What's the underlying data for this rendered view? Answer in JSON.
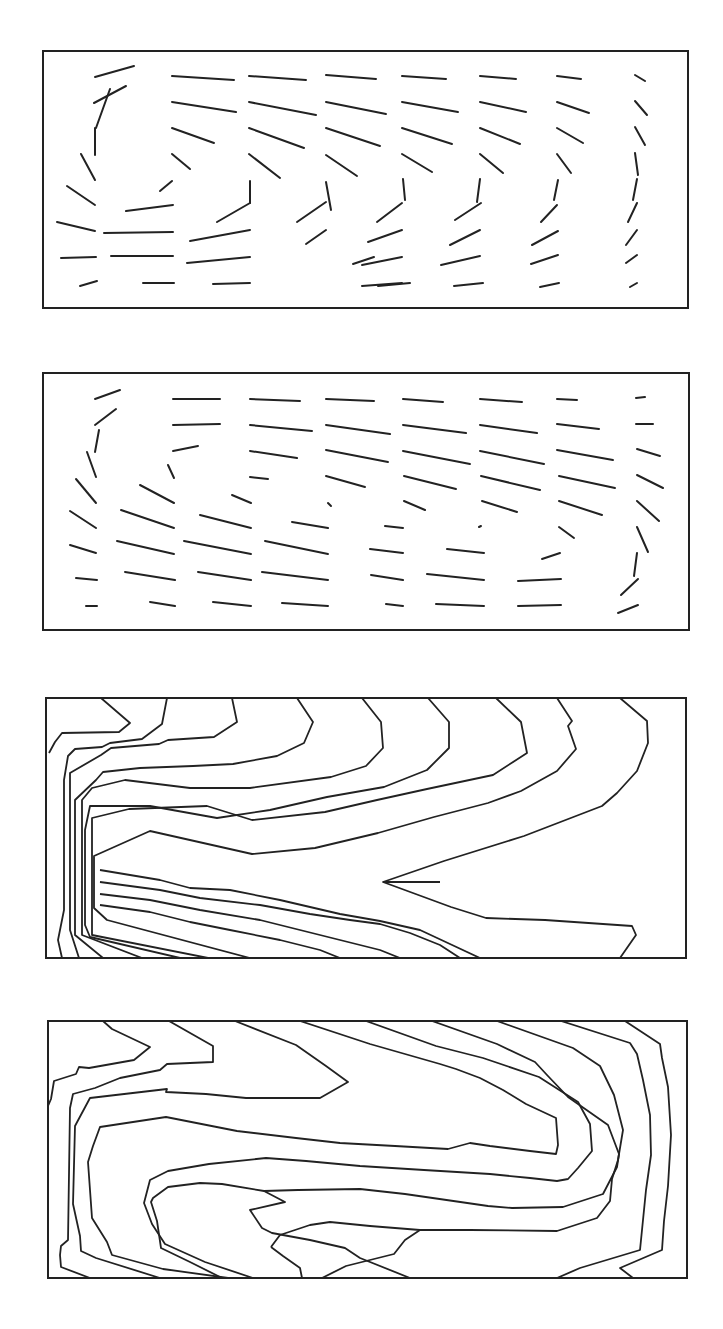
{
  "figure": {
    "panel_count": 4,
    "stroke_color": "#222222",
    "background": "#ffffff"
  },
  "chart_data": [
    {
      "type": "vector-field",
      "panel": 1,
      "title": "",
      "xlabel": "",
      "ylabel": "",
      "frame": [
        43,
        51,
        688,
        308
      ],
      "description": "Direction field of short line segments showing a clockwise recirculating cell in the left part of a rectangular cavity; flow along the top slopes down to the right, flow at the bottom is roughly horizontal, and segments near the right wall turn nearly vertical.",
      "segments": [
        [
          95,
          77,
          134,
          66
        ],
        [
          94,
          103,
          126,
          86
        ],
        [
          110,
          89,
          96,
          128
        ],
        [
          95,
          128,
          95,
          155
        ],
        [
          81,
          154,
          95,
          180
        ],
        [
          67,
          186,
          95,
          205
        ],
        [
          57,
          222,
          95,
          231
        ],
        [
          61,
          258,
          96,
          257
        ],
        [
          80,
          286,
          97,
          281
        ],
        [
          172,
          76,
          234,
          80
        ],
        [
          172,
          102,
          236,
          112
        ],
        [
          172,
          128,
          214,
          143
        ],
        [
          172,
          154,
          190,
          169
        ],
        [
          160,
          191,
          172,
          181
        ],
        [
          126,
          211,
          173,
          205
        ],
        [
          104,
          233,
          173,
          232
        ],
        [
          111,
          256,
          173,
          256
        ],
        [
          143,
          283,
          174,
          283
        ],
        [
          249,
          76,
          306,
          80
        ],
        [
          249,
          102,
          316,
          115
        ],
        [
          249,
          128,
          304,
          148
        ],
        [
          249,
          154,
          280,
          178
        ],
        [
          250,
          181,
          250,
          203
        ],
        [
          217,
          222,
          250,
          203
        ],
        [
          190,
          241,
          250,
          230
        ],
        [
          187,
          263,
          250,
          257
        ],
        [
          213,
          284,
          250,
          283
        ],
        [
          326,
          75,
          376,
          79
        ],
        [
          326,
          102,
          386,
          114
        ],
        [
          326,
          128,
          380,
          146
        ],
        [
          326,
          155,
          357,
          176
        ],
        [
          326,
          182,
          331,
          210
        ],
        [
          297,
          222,
          326,
          202
        ],
        [
          306,
          244,
          326,
          230
        ],
        [
          353,
          264,
          374,
          257
        ],
        [
          378,
          286,
          410,
          283
        ],
        [
          402,
          76,
          446,
          79
        ],
        [
          402,
          102,
          458,
          112
        ],
        [
          402,
          128,
          452,
          144
        ],
        [
          402,
          154,
          432,
          172
        ],
        [
          403,
          179,
          405,
          200
        ],
        [
          377,
          222,
          402,
          203
        ],
        [
          368,
          242,
          402,
          230
        ],
        [
          362,
          265,
          402,
          257
        ],
        [
          362,
          286,
          402,
          283
        ],
        [
          480,
          76,
          516,
          79
        ],
        [
          480,
          102,
          526,
          112
        ],
        [
          480,
          128,
          520,
          144
        ],
        [
          480,
          154,
          503,
          173
        ],
        [
          480,
          179,
          477,
          202
        ],
        [
          455,
          220,
          481,
          203
        ],
        [
          450,
          245,
          480,
          230
        ],
        [
          441,
          265,
          480,
          256
        ],
        [
          454,
          286,
          483,
          283
        ],
        [
          557,
          76,
          581,
          79
        ],
        [
          557,
          102,
          589,
          113
        ],
        [
          557,
          128,
          583,
          143
        ],
        [
          557,
          154,
          571,
          173
        ],
        [
          558,
          180,
          554,
          200
        ],
        [
          541,
          222,
          557,
          205
        ],
        [
          532,
          245,
          558,
          231
        ],
        [
          531,
          264,
          558,
          255
        ],
        [
          540,
          287,
          559,
          283
        ],
        [
          635,
          75,
          645,
          81
        ],
        [
          635,
          101,
          647,
          115
        ],
        [
          635,
          127,
          645,
          145
        ],
        [
          635,
          153,
          638,
          175
        ],
        [
          637,
          179,
          633,
          200
        ],
        [
          628,
          222,
          637,
          203
        ],
        [
          626,
          245,
          637,
          230
        ],
        [
          626,
          263,
          637,
          255
        ],
        [
          630,
          287,
          637,
          283
        ]
      ]
    },
    {
      "type": "vector-field",
      "panel": 2,
      "title": "",
      "xlabel": "",
      "ylabel": "",
      "frame": [
        43,
        373,
        689,
        630
      ],
      "description": "Direction field for a second case; flow is mostly near-horizontal and slopes down to the right across the cavity, with a recirculation in the upper-left corner and segments turning vertical near the lower-right wall.",
      "segments": [
        [
          95,
          399,
          120,
          390
        ],
        [
          95,
          425,
          116,
          409
        ],
        [
          99,
          430,
          95,
          452
        ],
        [
          87,
          452,
          96,
          477
        ],
        [
          76,
          479,
          96,
          503
        ],
        [
          70,
          511,
          96,
          528
        ],
        [
          70,
          545,
          96,
          553
        ],
        [
          76,
          578,
          97,
          580
        ],
        [
          86,
          606,
          97,
          606
        ],
        [
          173,
          399,
          220,
          399
        ],
        [
          173,
          425,
          220,
          424
        ],
        [
          173,
          451,
          198,
          446
        ],
        [
          168,
          465,
          174,
          478
        ],
        [
          140,
          485,
          174,
          503
        ],
        [
          121,
          510,
          174,
          528
        ],
        [
          117,
          541,
          174,
          554
        ],
        [
          125,
          572,
          175,
          580
        ],
        [
          150,
          602,
          175,
          606
        ],
        [
          250,
          399,
          300,
          401
        ],
        [
          250,
          425,
          312,
          431
        ],
        [
          250,
          451,
          297,
          458
        ],
        [
          250,
          477,
          268,
          479
        ],
        [
          232,
          495,
          251,
          503
        ],
        [
          200,
          515,
          251,
          528
        ],
        [
          184,
          541,
          251,
          554
        ],
        [
          198,
          572,
          251,
          580
        ],
        [
          213,
          602,
          251,
          606
        ],
        [
          326,
          399,
          374,
          401
        ],
        [
          326,
          425,
          390,
          434
        ],
        [
          326,
          450,
          388,
          462
        ],
        [
          326,
          476,
          365,
          487
        ],
        [
          328,
          503,
          331,
          506
        ],
        [
          292,
          522,
          328,
          528
        ],
        [
          265,
          541,
          328,
          554
        ],
        [
          262,
          572,
          328,
          580
        ],
        [
          282,
          603,
          328,
          606
        ],
        [
          403,
          399,
          443,
          402
        ],
        [
          403,
          425,
          466,
          433
        ],
        [
          403,
          451,
          470,
          464
        ],
        [
          404,
          476,
          456,
          489
        ],
        [
          404,
          501,
          425,
          510
        ],
        [
          385,
          526,
          403,
          528
        ],
        [
          370,
          549,
          403,
          553
        ],
        [
          371,
          575,
          403,
          580
        ],
        [
          386,
          604,
          403,
          606
        ],
        [
          480,
          399,
          522,
          402
        ],
        [
          480,
          425,
          537,
          433
        ],
        [
          480,
          451,
          544,
          464
        ],
        [
          481,
          476,
          540,
          490
        ],
        [
          482,
          501,
          517,
          512
        ],
        [
          479,
          527,
          481,
          526
        ],
        [
          447,
          549,
          484,
          553
        ],
        [
          427,
          574,
          484,
          580
        ],
        [
          436,
          604,
          484,
          606
        ],
        [
          557,
          399,
          577,
          400
        ],
        [
          557,
          424,
          599,
          429
        ],
        [
          557,
          450,
          613,
          460
        ],
        [
          559,
          476,
          615,
          488
        ],
        [
          559,
          501,
          602,
          515
        ],
        [
          559,
          527,
          574,
          538
        ],
        [
          542,
          559,
          560,
          553
        ],
        [
          518,
          581,
          561,
          579
        ],
        [
          518,
          606,
          561,
          605
        ],
        [
          636,
          398,
          645,
          397
        ],
        [
          636,
          424,
          653,
          424
        ],
        [
          637,
          449,
          660,
          456
        ],
        [
          637,
          475,
          663,
          488
        ],
        [
          637,
          501,
          659,
          521
        ],
        [
          637,
          527,
          648,
          552
        ],
        [
          637,
          553,
          634,
          576
        ],
        [
          621,
          595,
          638,
          579
        ],
        [
          618,
          613,
          638,
          605
        ]
      ]
    },
    {
      "type": "contour",
      "panel": 3,
      "title": "",
      "xlabel": "",
      "ylabel": "",
      "frame": [
        46,
        698,
        686,
        958
      ],
      "description": "Contour map of nested isolines; the innermost lines form a V-shaped tongue pointing left near mid-height, contours bunch tightly along the left wall and bottom, and fan out as arcs in the upper-right.",
      "lines": [
        "M101,698 L130,723 L119,732 L62,733 L55,742 L49,753",
        "M167,698 L162,724 L142,739 L110,743 L102,747 L75,749 L68,756 L64,780 L64,910 L58,940 L62,958",
        "M232,698 L237,722 L214,737 L168,740 L159,744 L111,748 L101,755 L70,773 L70,930 L79,958",
        "M297,698 L313,722 L304,743 L277,756 L233,764 L193,766 L140,768 L103,772 L96,780 L75,800 L75,935 L103,958",
        "M362,698 L381,722 L383,748 L366,766 L331,777 L250,788 L190,788 L125,780 L92,788 L82,800 L82,935 L142,958",
        "M428,698 L449,722 L449,748 L427,770 L384,787 L327,797 L270,810 L217,818 L150,806 L90,806 L85,830 L85,925 L90,937 L180,958",
        "M496,698 L521,722 L527,753 L493,775 L427,789 L377,800 L325,812 L252,820 L207,806 L129,809 L92,818 L92,935 L208,958",
        "M557,698 L572,721 L568,726 L576,749 L557,771 L521,791 L488,803 L434,817 L378,833 L315,848 L252,854 L150,831 L94,856 L94,908 L107,920 L250,958",
        "M620,698 L647,721 L648,743 L637,771 L617,793 L602,806 L524,836 L444,861 L383,882 L451,907 L486,918 L545,920 L632,926 L636,935 L620,958",
        "M383,882 L440,882",
        "M100,870 L160,880 L190,888 L230,890 L280,900 L340,914 L380,921 L420,930 L450,944 L480,958",
        "M100,882 L160,890 L200,898 L260,905 L310,914 L350,920 L380,924 L410,933 L440,945 L460,958",
        "M100,894 L150,900 L200,910 L260,920 L300,930 L340,940 L380,950 L400,958",
        "M100,905 L150,912 L190,922 L230,930 L280,940 L320,950 L340,958"
      ]
    },
    {
      "type": "contour",
      "panel": 4,
      "title": "",
      "xlabel": "",
      "ylabel": "",
      "frame": [
        48,
        1021,
        687,
        1278
      ],
      "description": "Contour map of nested isolines forming a horizontally elongated loop; contours wrap around a center located right of mid-width, with a notched inner line pointing left near the lower middle and lines hugging the right wall.",
      "lines": [
        "M103,1021 L112,1029 L150,1047 L134,1060 L89,1068 L79,1067 L76,1074 L54,1081 L51,1099 L48,1106",
        "M169,1021 L213,1046 L213,1062 L167,1064 L160,1070 L120,1078 L95,1088 L73,1094 L70,1108 L68,1240 L61,1246 L60,1255 L61,1267 L90,1278",
        "M235,1021 L296,1045 L326,1066 L348,1082 L320,1098 L246,1098 L206,1094 L166,1092 L166,1092 L167,1089 L90,1098 L75,1126 L73,1204 L80,1236 L81,1251 L96,1258 L160,1278",
        "M300,1021 L370,1044 L440,1064 L456,1069 L480,1078 L503,1090 L526,1104 L556,1118 L558,1145 L556,1154 L530,1151 L490,1146 L470,1143 L448,1149 L395,1146 L340,1143 L296,1138 L237,1131 L166,1117 L100,1127 L93,1146 L88,1162 L90,1190 L92,1218 L107,1242 L112,1255 L163,1269 L228,1278",
        "M366,1021 L436,1046 L483,1058 L539,1077 L578,1102 L590,1124 L592,1151 L578,1168 L568,1179 L557,1181 L530,1178 L490,1174 L424,1170 L360,1166 L306,1161 L266,1158 L209,1164 L168,1171 L150,1180 L144,1203 L152,1224 L165,1244 L205,1262 L253,1278",
        "M432,1021 L497,1044 L535,1062 L547,1075 L568,1097 L608,1125 L619,1154 L617,1167 L603,1194 L563,1207 L512,1208 L488,1206 L405,1194 L360,1189 L298,1190 L264,1191 L222,1184 L200,1183 L168,1187 L153,1198 L151,1202 L157,1221 L161,1248 L190,1262 L222,1278",
        "M497,1021 L573,1048 L600,1066 L614,1095 L623,1130 L618,1160 L612,1179 L610,1201 L597,1218 L557,1231 L470,1230 L420,1230 L405,1240 L394,1254 L346,1266 L322,1278",
        "M561,1021 L630,1043 L637,1054 L643,1080 L650,1115 L651,1155 L646,1190 L643,1220 L640,1250 L580,1268 L557,1278",
        "M625,1021 L660,1044 L662,1058 L668,1087 L671,1135 L668,1186 L664,1221 L662,1250 L620,1268 L633,1278",
        "M271,1247 L280,1235 L310,1225 L330,1222 L370,1226 L420,1230",
        "M271,1247 L283,1256 L300,1268 L302,1278",
        "M264,1191 L285,1202 L250,1210 L262,1228 L272,1233 L310,1240 L345,1248 L360,1258 L410,1278"
      ]
    }
  ]
}
